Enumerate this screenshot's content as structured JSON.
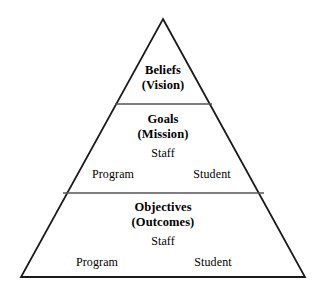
{
  "diagram": {
    "type": "pyramid",
    "title_visible": false,
    "background_color": "#ffffff",
    "outline_color": "#1a1a1a",
    "divider_color": "#555555",
    "text_color": "#000000",
    "geometry": {
      "apex": [
        163,
        19
      ],
      "base_left": [
        21,
        277
      ],
      "base_right": [
        305,
        277
      ],
      "divider_1_y": 104,
      "divider_1_x": [
        115,
        212
      ],
      "divider_2_y": 193,
      "divider_2_x": [
        63,
        264
      ]
    },
    "tiers": [
      {
        "id": "tier-beliefs",
        "heading": "Beliefs",
        "subheading": "(Vision)",
        "heading_pos": [
          163,
          71
        ],
        "subheading_pos": [
          163,
          86
        ],
        "roles": []
      },
      {
        "id": "tier-goals",
        "heading": "Goals",
        "subheading": "(Mission)",
        "heading_pos": [
          163,
          120
        ],
        "subheading_pos": [
          163,
          135
        ],
        "roles": [
          {
            "label": "Staff",
            "pos": [
              163,
              153
            ]
          },
          {
            "label": "Program",
            "pos": [
              113,
              174
            ]
          },
          {
            "label": "Student",
            "pos": [
              212,
              174
            ]
          }
        ]
      },
      {
        "id": "tier-objectives",
        "heading": "Objectives",
        "subheading": "(Outcomes)",
        "heading_pos": [
          163,
          208
        ],
        "subheading_pos": [
          163,
          223
        ],
        "roles": [
          {
            "label": "Staff",
            "pos": [
              163,
              241
            ]
          },
          {
            "label": "Program",
            "pos": [
              97,
              262
            ]
          },
          {
            "label": "Student",
            "pos": [
              213,
              262
            ]
          }
        ]
      }
    ]
  }
}
